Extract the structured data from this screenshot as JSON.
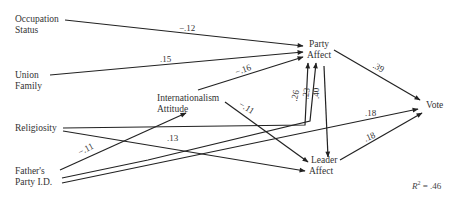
{
  "diagram": {
    "type": "path-diagram",
    "nodes": {
      "occupation_status": {
        "line1": "Occupation",
        "line2": "Status"
      },
      "union_family": {
        "line1": "Union",
        "line2": "Family"
      },
      "religiosity": {
        "line1": "Religiosity"
      },
      "fathers_party_id": {
        "line1": "Father's",
        "line2": "Party I.D."
      },
      "internationalism": {
        "line1": "Internationalism",
        "line2": "Attitude"
      },
      "party_affect": {
        "line1": "Party",
        "line2": "Affect"
      },
      "leader_affect": {
        "line1": "Leader",
        "line2": "Affect"
      },
      "vote": {
        "line1": "Vote"
      }
    },
    "edges": [
      {
        "from": "Occupation Status",
        "to": "Party Affect",
        "coef": "−.12"
      },
      {
        "from": "Union Family",
        "to": "Party Affect",
        "coef": ".15"
      },
      {
        "from": "Internationalism Attitude",
        "to": "Party Affect",
        "coef": "−.16"
      },
      {
        "from": "Religiosity",
        "to": "Party Affect",
        "coef": ".26"
      },
      {
        "from": "Father's Party I.D.",
        "to": "Party Affect",
        "coef": ".23"
      },
      {
        "from": "Party Affect",
        "to": "Leader Affect",
        "coef": ".40"
      },
      {
        "from": "Party Affect",
        "to": "Vote",
        "coef": ".39"
      },
      {
        "from": "Internationalism Attitude",
        "to": "Leader Affect",
        "coef": "−.11"
      },
      {
        "from": "Religiosity",
        "to": "Leader Affect",
        "coef": ".13"
      },
      {
        "from": "Father's Party I.D.",
        "to": "Internationalism Attitude",
        "coef": "−.11"
      },
      {
        "from": "Father's Party I.D.",
        "to": "Vote",
        "coef": ".18"
      },
      {
        "from": "Leader Affect",
        "to": "Vote",
        "coef": ".18"
      }
    ],
    "coefficients": {
      "occ_party": "−.12",
      "union_party": ".15",
      "intl_party": "−.16",
      "relig_party": ".26",
      "father_party": ".23",
      "party_leader": ".40",
      "party_vote": ".39",
      "intl_leader": "−.11",
      "relig_leader": ".13",
      "father_intl": "−.11",
      "father_vote": ".18",
      "leader_vote": ".18"
    },
    "r_squared": {
      "label": "R",
      "sup": "2",
      "value": " = .46"
    }
  }
}
